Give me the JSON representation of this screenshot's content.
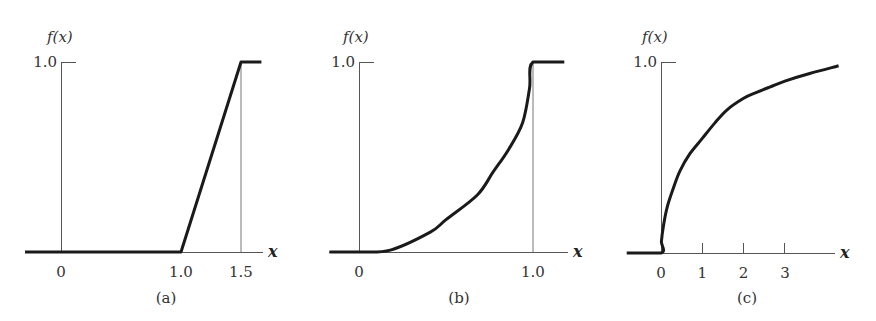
{
  "chart_data": [
    {
      "type": "line",
      "panel_label": "(a)",
      "ylabel": "f(x)",
      "xlabel": "x",
      "ytick_labels": [
        "1.0"
      ],
      "yticks": [
        1.0
      ],
      "xticks": [
        0,
        1.0,
        1.5
      ],
      "xtick_labels": [
        "0",
        "1.0",
        "1.5"
      ],
      "xlim": [
        -0.3,
        1.75
      ],
      "ylim": [
        0,
        1.0
      ],
      "guides_x": [
        1.5
      ],
      "series": [
        {
          "name": "f(x)",
          "x": [
            -0.3,
            1.0,
            1.5,
            1.67
          ],
          "y": [
            0,
            0,
            1.0,
            1.0
          ]
        }
      ]
    },
    {
      "type": "line",
      "panel_label": "(b)",
      "ylabel": "f(x)",
      "xlabel": "x",
      "ytick_labels": [
        "1.0"
      ],
      "yticks": [
        1.0
      ],
      "xticks": [
        0,
        1.0
      ],
      "xtick_labels": [
        "0",
        "1.0"
      ],
      "xlim": [
        -0.17,
        1.2
      ],
      "ylim": [
        0,
        1.0
      ],
      "guides_x": [
        1.0
      ],
      "series": [
        {
          "name": "f(x)",
          "x": [
            -0.17,
            0,
            0.18,
            0.41,
            0.5,
            0.68,
            0.77,
            0.86,
            0.94,
            0.98,
            1.0,
            1.18
          ],
          "y": [
            0,
            0,
            0.01,
            0.105,
            0.17,
            0.3,
            0.42,
            0.54,
            0.68,
            0.86,
            1.0,
            1.0
          ]
        }
      ]
    },
    {
      "type": "line",
      "panel_label": "(c)",
      "ylabel": "f(x)",
      "xlabel": "x",
      "ytick_labels": [
        "1.0"
      ],
      "yticks": [
        1.0
      ],
      "xticks": [
        0,
        1,
        2,
        3
      ],
      "xtick_labels": [
        "0",
        "1",
        "2",
        "3"
      ],
      "xlim": [
        -0.83,
        4.2
      ],
      "ylim": [
        0,
        1.0
      ],
      "guides_x": [],
      "series": [
        {
          "name": "f(x)",
          "x": [
            -0.83,
            0,
            0.01,
            0.05,
            0.15,
            0.3,
            0.46,
            0.7,
            1.0,
            1.3,
            1.6,
            2.0,
            2.3,
            2.65,
            3.0,
            3.6,
            4.3
          ],
          "y": [
            0,
            0,
            0.06,
            0.13,
            0.24,
            0.34,
            0.43,
            0.52,
            0.6,
            0.68,
            0.75,
            0.81,
            0.84,
            0.87,
            0.9,
            0.94,
            0.98
          ]
        }
      ]
    }
  ]
}
